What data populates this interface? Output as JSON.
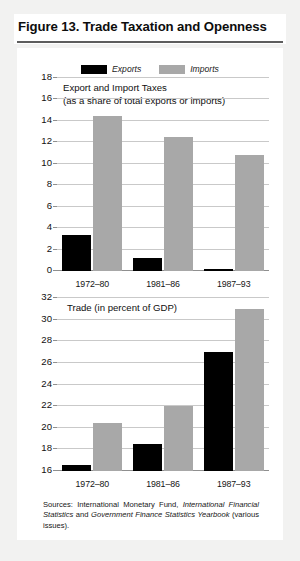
{
  "figure": {
    "title": "Figure 13.  Trade Taxation and Openness",
    "source_prefix": "Sources: International  Monetary  Fund, ",
    "source_italic_1": "International  Financial Statistics",
    "source_mid": " and ",
    "source_italic_2": "Government Finance Statistics Yearbook",
    "source_suffix": " (various issues)."
  },
  "legend": {
    "exports_label": "Exports",
    "imports_label": "Imports",
    "exports_color": "#000000",
    "imports_color": "#a8a8a8"
  },
  "chart_data": [
    {
      "type": "bar",
      "id": "export-import-taxes",
      "title": "Export and Import Taxes",
      "subtitle": "(as a share of total exports or imports)",
      "xlabel": "",
      "ylabel": "",
      "categories": [
        "1972–80",
        "1981–86",
        "1987–93"
      ],
      "series": [
        {
          "name": "Exports",
          "color": "#000000",
          "values": [
            3.4,
            1.2,
            0.2
          ]
        },
        {
          "name": "Imports",
          "color": "#a8a8a8",
          "values": [
            14.5,
            12.5,
            10.8
          ]
        }
      ],
      "ylim": [
        0,
        18
      ],
      "yticks": [
        0,
        2,
        4,
        6,
        8,
        10,
        12,
        14,
        16,
        18
      ],
      "grid": true,
      "legend_position": "top-center"
    },
    {
      "type": "bar",
      "id": "trade-percent-gdp",
      "title": "Trade (in percent of GDP)",
      "subtitle": "",
      "xlabel": "",
      "ylabel": "",
      "categories": [
        "1972–80",
        "1981–86",
        "1987–93"
      ],
      "series": [
        {
          "name": "Exports",
          "color": "#000000",
          "values": [
            16.6,
            18.5,
            27.0
          ]
        },
        {
          "name": "Imports",
          "color": "#a8a8a8",
          "values": [
            20.4,
            22.0,
            31.0
          ]
        }
      ],
      "ylim": [
        16,
        32
      ],
      "yticks": [
        16,
        18,
        20,
        22,
        24,
        26,
        28,
        30,
        32
      ],
      "grid": true,
      "legend_position": "none"
    }
  ]
}
